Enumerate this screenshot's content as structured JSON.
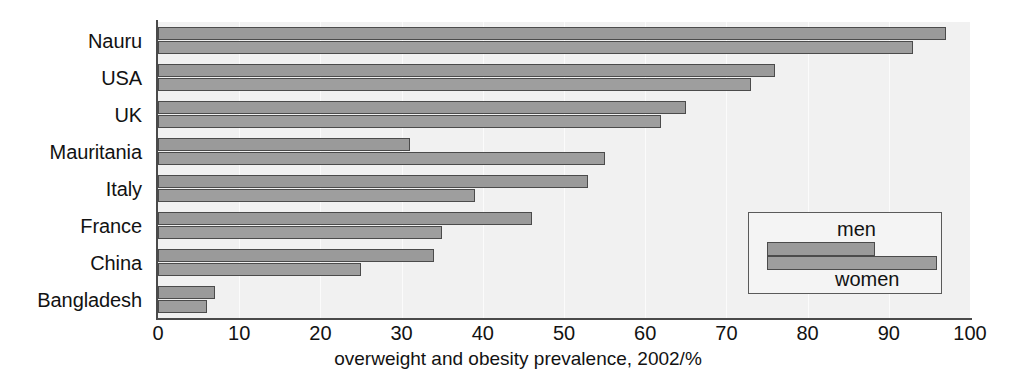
{
  "chart_data": {
    "type": "bar",
    "orientation": "horizontal",
    "title": "",
    "xlabel": "overweight and obesity prevalence, 2002/%",
    "ylabel": "",
    "xlim": [
      0,
      100
    ],
    "xticks": [
      0,
      10,
      20,
      30,
      40,
      50,
      60,
      70,
      80,
      90,
      100
    ],
    "grid": true,
    "legend_position": "inside-bottom-right",
    "categories": [
      "Nauru",
      "USA",
      "UK",
      "Mauritania",
      "Italy",
      "France",
      "China",
      "Bangladesh"
    ],
    "series": [
      {
        "name": "men",
        "values": [
          97,
          76,
          65,
          31,
          53,
          46,
          34,
          7
        ],
        "color": "#9a9a9a"
      },
      {
        "name": "women",
        "values": [
          93,
          73,
          62,
          55,
          39,
          35,
          25,
          6
        ],
        "color": "#9e9e9e"
      }
    ]
  },
  "axis": {
    "tick_labels": [
      "0",
      "10",
      "20",
      "30",
      "40",
      "50",
      "60",
      "70",
      "80",
      "90",
      "100"
    ],
    "x_axis_title": "overweight and obesity prevalence, 2002/%"
  },
  "categories": [
    "Nauru",
    "USA",
    "UK",
    "Mauritania",
    "Italy",
    "France",
    "China",
    "Bangladesh"
  ],
  "legend": {
    "men_label": "men",
    "women_label": "women"
  },
  "colors": {
    "bar_men": "#9a9a9a",
    "bar_women": "#9e9e9e",
    "bar_outline": "#4b4b4b",
    "plot_background": "#f1f1f1",
    "axis": "#4a4a4a",
    "text": "#121212"
  }
}
